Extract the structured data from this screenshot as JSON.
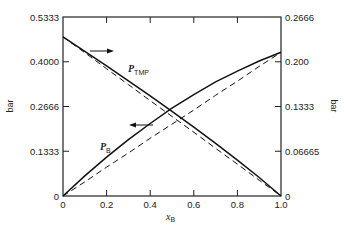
{
  "chart_data": {
    "type": "line",
    "title": "",
    "xlabel": "x_B",
    "ylabel": "bar",
    "ylabel_right": "bar",
    "xlim": [
      0,
      1.0
    ],
    "ylim": [
      0,
      0.5333
    ],
    "ylim_right": [
      0,
      0.2666
    ],
    "x_ticks": [
      "0",
      "0.2",
      "0.4",
      "0.6",
      "0.8",
      "1.0"
    ],
    "y_ticks_left": [
      "0",
      "0.1333",
      "0.2666",
      "0.4000",
      "0.5333"
    ],
    "y_ticks_right": [
      "0",
      "0.06665",
      "0.1333",
      "0.200",
      "0.2666"
    ],
    "grid": false,
    "x": [
      0,
      0.1,
      0.2,
      0.3,
      0.4,
      0.5,
      0.6,
      0.7,
      0.8,
      0.9,
      1.0
    ],
    "series": [
      {
        "name": "P_TMP",
        "style": "solid",
        "axis": "left",
        "values": [
          0.474,
          0.431,
          0.388,
          0.343,
          0.298,
          0.252,
          0.205,
          0.157,
          0.107,
          0.055,
          0
        ]
      },
      {
        "name": "P_TMP ideal",
        "style": "dashed",
        "axis": "left",
        "values": [
          0.474,
          0.427,
          0.379,
          0.332,
          0.284,
          0.237,
          0.19,
          0.142,
          0.095,
          0.047,
          0
        ]
      },
      {
        "name": "P_B",
        "style": "solid",
        "axis": "right",
        "values": [
          0,
          0.03,
          0.058,
          0.084,
          0.108,
          0.131,
          0.151,
          0.17,
          0.186,
          0.201,
          0.214
        ]
      },
      {
        "name": "P_B ideal",
        "style": "dashed",
        "axis": "right",
        "values": [
          0,
          0.021,
          0.043,
          0.064,
          0.086,
          0.107,
          0.128,
          0.15,
          0.171,
          0.193,
          0.214
        ]
      }
    ],
    "annotations": [
      {
        "text": "P_TMP",
        "note": "arrow pointing right to right axis"
      },
      {
        "text": "P_B",
        "note": "arrow pointing left to left axis"
      }
    ]
  },
  "labels": {
    "xlabel_main": "x",
    "xlabel_sub": "B",
    "ylabel_left": "bar",
    "ylabel_right": "bar",
    "ptmp_main": "P",
    "ptmp_sub": "TMP",
    "pb_main": "P",
    "pb_sub": "B"
  }
}
